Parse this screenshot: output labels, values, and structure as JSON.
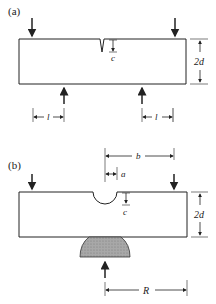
{
  "panels": [
    {
      "label": "(a)",
      "dims": {
        "crack_depth": "c",
        "height": "2d",
        "span_left": "l",
        "span_right": "l"
      }
    },
    {
      "label": "(b)",
      "dims": {
        "offset_b": "b",
        "radius_a": "a",
        "depth": "c",
        "height": "2d",
        "support_radius": "R"
      }
    }
  ],
  "colors": {
    "line": "#222222",
    "support_fill": "#9a9a9a",
    "background": "#ffffff"
  }
}
